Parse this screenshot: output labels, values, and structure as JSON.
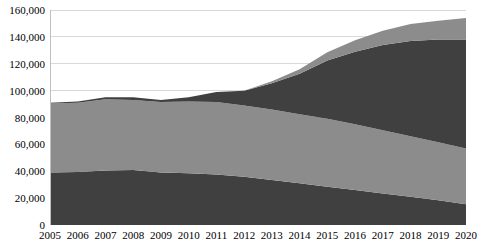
{
  "chart_data": {
    "type": "area",
    "stacked": true,
    "title": "",
    "xlabel": "",
    "ylabel": "",
    "grid": true,
    "legend": "none",
    "ylim": [
      0,
      160000
    ],
    "ytick_labels": [
      "0",
      "20,000",
      "40,000",
      "60,000",
      "80,000",
      "100,000",
      "120,000",
      "140,000",
      "160,000"
    ],
    "ytick_values": [
      0,
      20000,
      40000,
      60000,
      80000,
      100000,
      120000,
      140000,
      160000
    ],
    "categories": [
      "2005",
      "2006",
      "2007",
      "2008",
      "2009",
      "2010",
      "2011",
      "2012",
      "2013",
      "2014",
      "2015",
      "2016",
      "2017",
      "2018",
      "2019",
      "2020"
    ],
    "x": [
      2005,
      2006,
      2007,
      2008,
      2009,
      2010,
      2011,
      2012,
      2013,
      2014,
      2015,
      2016,
      2017,
      2018,
      2019,
      2020
    ],
    "series": [
      {
        "name": "series-1-bottom-dark",
        "color": "#404040",
        "values": [
          39000,
          39500,
          40500,
          41000,
          39000,
          38500,
          37500,
          36000,
          33500,
          31000,
          28500,
          26000,
          23500,
          21000,
          18500,
          15500
        ]
      },
      {
        "name": "series-2-middle-gray",
        "color": "#8c8c8c",
        "values": [
          51500,
          51500,
          53000,
          52000,
          52500,
          53500,
          54000,
          53000,
          52500,
          51500,
          50500,
          49000,
          47000,
          45000,
          43000,
          41500
        ]
      },
      {
        "name": "series-3-upper-dark",
        "color": "#404040",
        "values": [
          500,
          1000,
          1500,
          2000,
          1500,
          3000,
          7500,
          11000,
          19500,
          30000,
          43500,
          54000,
          63500,
          71000,
          76500,
          81000
        ]
      },
      {
        "name": "series-4-top-gray",
        "color": "#8c8c8c",
        "values": [
          0,
          0,
          0,
          0,
          0,
          0,
          0,
          0,
          1500,
          3500,
          6000,
          8500,
          10500,
          12500,
          14000,
          16000
        ]
      }
    ],
    "totals": [
      91000,
      92000,
      95000,
      95000,
      93000,
      95000,
      99000,
      100000,
      107000,
      116000,
      128500,
      137500,
      144500,
      149500,
      152000,
      154000
    ],
    "colors": {
      "dark": "#404040",
      "gray": "#8c8c8c",
      "gridline": "#d9d9d9",
      "axis": "#bfbfbf",
      "text": "#000000",
      "background": "#ffffff"
    },
    "axis_geometry": {
      "plot_left": 50,
      "plot_top": 10,
      "plot_width": 416,
      "plot_height": 215
    }
  }
}
